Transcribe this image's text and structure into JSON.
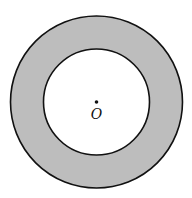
{
  "diagram": {
    "type": "annulus",
    "center": {
      "x": 96.5,
      "y": 102,
      "label": "O"
    },
    "outer_circle": {
      "r": 86
    },
    "inner_circle": {
      "r": 53
    },
    "colors": {
      "fill": "#bdbdbd",
      "stroke": "#111111",
      "inner_fill": "#ffffff",
      "background": "#ffffff"
    }
  }
}
